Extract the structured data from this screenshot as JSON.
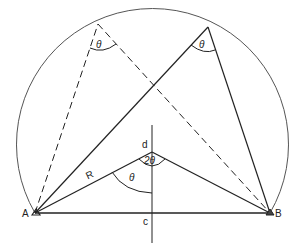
{
  "diagram": {
    "points": {
      "A": {
        "label": "A",
        "x": 35,
        "y": 213
      },
      "B": {
        "label": "B",
        "x": 270,
        "y": 213
      },
      "d": {
        "label": "d",
        "x": 152,
        "y": 152
      },
      "c": {
        "label": "c",
        "x": 152,
        "y": 213
      },
      "P1": {
        "x": 98,
        "y": 24
      },
      "P2": {
        "x": 208,
        "y": 27
      }
    },
    "labels": {
      "A": "A",
      "B": "B",
      "c": "c",
      "d": "d",
      "R": "R",
      "theta_left_top": "θ",
      "theta_right_top": "θ",
      "theta_center": "θ",
      "two_theta": "2θ"
    },
    "colors": {
      "line": "#222222",
      "circle": "#555555",
      "background": "#ffffff"
    }
  }
}
